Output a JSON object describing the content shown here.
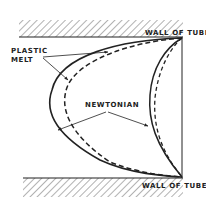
{
  "diagram": {
    "labels": {
      "wall_top": "WALL OF TUBE",
      "wall_bottom": "WALL OF TUBE",
      "plastic_line1": "PLASTIC",
      "plastic_line2": "MELT",
      "newtonian": "NEWTONIAN"
    },
    "legend": [
      {
        "series": "plastic melt",
        "style": "solid"
      },
      {
        "series": "newtonian",
        "style": "dashed"
      }
    ],
    "colors": {
      "ink": "#222222",
      "background": "#ffffff"
    }
  }
}
